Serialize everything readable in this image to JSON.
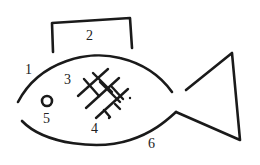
{
  "diagram": {
    "type": "labeled-line-drawing",
    "colors": {
      "stroke": "#1a1a1a",
      "background": "#ffffff"
    },
    "labels": {
      "l1": "1",
      "l2": "2",
      "l3": "3",
      "l4": "4",
      "l5": "5",
      "l6": "6"
    },
    "parts": [
      {
        "id": "1",
        "element": "upper body curve"
      },
      {
        "id": "2",
        "element": "dorsal bracket"
      },
      {
        "id": "3",
        "element": "crosshatch upper-left"
      },
      {
        "id": "4",
        "element": "crosshatch lower"
      },
      {
        "id": "5",
        "element": "eye circle"
      },
      {
        "id": "6",
        "element": "lower body curve"
      }
    ]
  }
}
